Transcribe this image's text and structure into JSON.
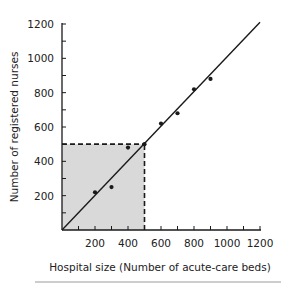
{
  "chart_data": {
    "type": "scatter",
    "title": "",
    "xlabel": "Hospital size (Number of acute-care beds)",
    "ylabel": "Number of registered nurses",
    "xlim": [
      0,
      1200
    ],
    "ylim": [
      0,
      1200
    ],
    "x_ticks": [
      200,
      400,
      600,
      800,
      1000,
      1200
    ],
    "y_ticks": [
      200,
      400,
      600,
      800,
      1000,
      1200
    ],
    "x_tick_labels": [
      "200",
      "400",
      "600",
      "800",
      "1000",
      "1200"
    ],
    "y_tick_labels": [
      "200",
      "400",
      "600",
      "800",
      "1000",
      "1200"
    ],
    "grid": false,
    "series": [
      {
        "name": "Hospitals",
        "type": "scatter",
        "points": [
          {
            "x": 200,
            "y": 220
          },
          {
            "x": 300,
            "y": 250
          },
          {
            "x": 400,
            "y": 480
          },
          {
            "x": 500,
            "y": 500
          },
          {
            "x": 600,
            "y": 620
          },
          {
            "x": 700,
            "y": 680
          },
          {
            "x": 800,
            "y": 820
          },
          {
            "x": 900,
            "y": 880
          }
        ]
      },
      {
        "name": "Fit line",
        "type": "line",
        "points": [
          {
            "x": 0,
            "y": 0
          },
          {
            "x": 1200,
            "y": 1210
          }
        ]
      }
    ],
    "annotations": [
      {
        "type": "shaded-region",
        "x": [
          0,
          500
        ],
        "y": [
          0,
          500
        ],
        "color": "#d9d9d9"
      },
      {
        "type": "dashed-line",
        "from": {
          "x": 0,
          "y": 500
        },
        "to": {
          "x": 500,
          "y": 500
        }
      },
      {
        "type": "dashed-line",
        "from": {
          "x": 500,
          "y": 0
        },
        "to": {
          "x": 500,
          "y": 500
        }
      }
    ],
    "colors": {
      "axis": "#1a1a1a",
      "points": "#1a1a1a",
      "shade": "#d9d9d9",
      "separator": "#9a9a9a"
    }
  }
}
